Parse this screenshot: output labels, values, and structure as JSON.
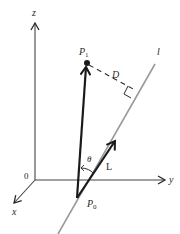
{
  "diagram": {
    "type": "3d-vector-geometry",
    "colors": {
      "stroke": "#2a2a2a",
      "axis": "#444444",
      "line_l": "#9a9a9a"
    },
    "axes": {
      "z_label": "z",
      "y_label": "y",
      "x_label": "x",
      "origin_label": "0"
    },
    "points": {
      "p1_label": "P",
      "p1_sub": "1",
      "p0_label": "P",
      "p0_sub": "0"
    },
    "labels": {
      "line_label": "l",
      "distance_label": "D",
      "angle_label": "θ",
      "vector_label": "L"
    }
  }
}
